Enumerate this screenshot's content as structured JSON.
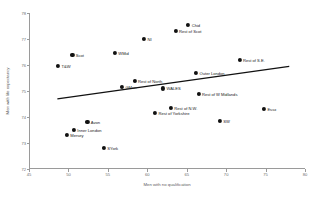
{
  "header": {
    "text": ""
  },
  "chart_data": {
    "type": "scatter",
    "title": "",
    "xlabel": "Men with no qualification",
    "ylabel": "Men with life expectancy",
    "xlim": [
      45,
      80
    ],
    "ylim": [
      72,
      78
    ],
    "xticks": [
      45,
      50,
      55,
      60,
      65,
      70,
      75,
      80
    ],
    "yticks": [
      72,
      73,
      74,
      75,
      76,
      77,
      78
    ],
    "grid": false,
    "legend": null,
    "points": [
      {
        "label": "Chid",
        "x": 65.2,
        "y": 77.55,
        "label_side": "right"
      },
      {
        "label": "Rest of Scot",
        "x": 63.6,
        "y": 77.3,
        "label_side": "right"
      },
      {
        "label": "NI",
        "x": 59.6,
        "y": 77.0,
        "label_side": "right"
      },
      {
        "label": "WMid",
        "x": 55.9,
        "y": 76.45,
        "label_side": "right"
      },
      {
        "label": "Scot",
        "x": 50.5,
        "y": 76.4,
        "label_side": "right"
      },
      {
        "label": "T&W",
        "x": 48.7,
        "y": 75.95,
        "label_side": "right"
      },
      {
        "label": "Rest of S.E.",
        "x": 71.7,
        "y": 76.2,
        "label_side": "right"
      },
      {
        "label": "Outer London",
        "x": 66.2,
        "y": 75.7,
        "label_side": "right"
      },
      {
        "label": "Rest of North",
        "x": 58.4,
        "y": 75.4,
        "label_side": "right"
      },
      {
        "label": "GMan",
        "x": 56.8,
        "y": 75.15,
        "label_side": "right"
      },
      {
        "label": "WALES",
        "x": 62.0,
        "y": 75.1,
        "label_side": "right"
      },
      {
        "label": "Rest of W Midlands",
        "x": 66.5,
        "y": 74.9,
        "label_side": "right"
      },
      {
        "label": "Rest of N.W.",
        "x": 63.0,
        "y": 74.35,
        "label_side": "right"
      },
      {
        "label": "Rest of Yorkshire",
        "x": 61.0,
        "y": 74.15,
        "label_side": "right"
      },
      {
        "label": "Essx",
        "x": 74.8,
        "y": 74.3,
        "label_side": "right"
      },
      {
        "label": "SW",
        "x": 69.2,
        "y": 73.85,
        "label_side": "right"
      },
      {
        "label": "Avon",
        "x": 52.4,
        "y": 73.8,
        "label_side": "right"
      },
      {
        "label": "Inner London",
        "x": 50.7,
        "y": 73.5,
        "label_side": "right"
      },
      {
        "label": "Mersey",
        "x": 49.8,
        "y": 73.3,
        "label_side": "right"
      },
      {
        "label": "SYork",
        "x": 54.5,
        "y": 72.8,
        "label_side": "right"
      }
    ],
    "trendline": {
      "x0": 48.6,
      "y0": 74.7,
      "x1": 78.0,
      "y1": 75.95
    }
  }
}
